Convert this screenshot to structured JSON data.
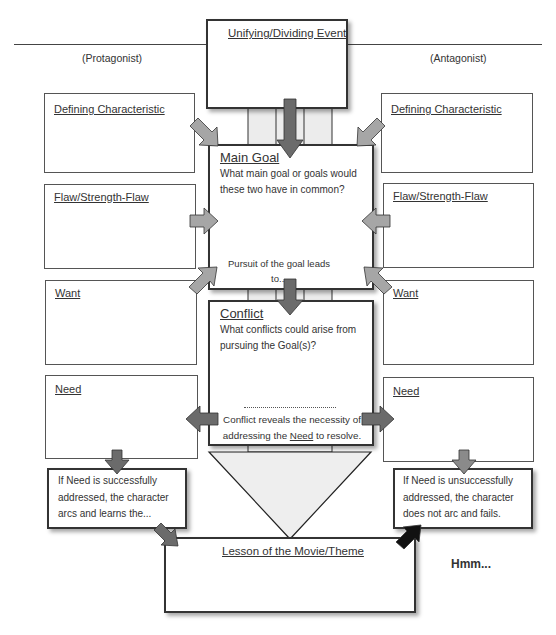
{
  "top_labels": {
    "protagonist": "(Protagonist)",
    "antagonist": "(Antagonist)"
  },
  "center": {
    "event": {
      "title": "Unifying/Dividing Event"
    },
    "main_goal": {
      "title": "Main Goal",
      "prompt": "What main goal or goals would these two have in common?",
      "footer": "Pursuit of the goal leads to..."
    },
    "conflict": {
      "title": "Conflict",
      "prompt": "What conflicts could arise from pursuing the Goal(s)?",
      "footer_pre": "Conflict reveals the necessity of addressing the ",
      "footer_link": "Need",
      "footer_post": " to resolve."
    },
    "lesson": {
      "title": "Lesson of the Movie/Theme"
    }
  },
  "protagonist_boxes": [
    {
      "title": "Defining Characteristic"
    },
    {
      "title": "Flaw/Strength-Flaw"
    },
    {
      "title": "Want"
    },
    {
      "title": "Need"
    }
  ],
  "antagonist_boxes": [
    {
      "title": "Defining Characteristic"
    },
    {
      "title": "Flaw/Strength-Flaw"
    },
    {
      "title": "Want"
    },
    {
      "title": "Need"
    }
  ],
  "outcomes": {
    "success": "If Need is successfully addressed, the character arcs and learns the...",
    "failure": "If Need is unsuccessfully addressed, the character does not arc and fails."
  },
  "note": "Hmm...",
  "colors": {
    "arrow_light": "#a6a6a6",
    "arrow_dark": "#6b6b6b",
    "arrow_black": "#111111",
    "funnel_fill": "#eeeeee",
    "border": "#333333"
  }
}
